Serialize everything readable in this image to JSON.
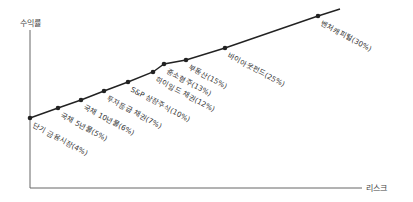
{
  "chart_data": {
    "type": "line",
    "title": "",
    "ylabel": "수익률",
    "xlabel": "리스크",
    "points": [
      {
        "label": "단기 금융시장(4%)",
        "return_pct": 4,
        "x": 30,
        "y": 118
      },
      {
        "label": "국채 5년물(5%)",
        "return_pct": 5,
        "x": 58,
        "y": 108
      },
      {
        "label": "국채 10년물(6%)",
        "return_pct": 6,
        "x": 81,
        "y": 100
      },
      {
        "label": "투자등급 채권(7%)",
        "return_pct": 7,
        "x": 104,
        "y": 91
      },
      {
        "label": "S&P 상장주식(10%)",
        "return_pct": 10,
        "x": 128,
        "y": 82
      },
      {
        "label": "하이일드 채권(12%)",
        "return_pct": 12,
        "x": 153,
        "y": 72
      },
      {
        "label": "중소형주(13%)",
        "return_pct": 13,
        "x": 164,
        "y": 64
      },
      {
        "label": "부동산(15%)",
        "return_pct": 15,
        "x": 186,
        "y": 60
      },
      {
        "label": "바이아웃펀드(25%)",
        "return_pct": 25,
        "x": 225,
        "y": 48
      },
      {
        "label": "벤처캐피털(30%)",
        "return_pct": 30,
        "x": 318,
        "y": 16
      }
    ]
  },
  "axes": {
    "y_label": "수익률",
    "x_label": "리스크"
  },
  "colors": {
    "line": "#222222",
    "axis": "#555555",
    "text": "#333333"
  }
}
